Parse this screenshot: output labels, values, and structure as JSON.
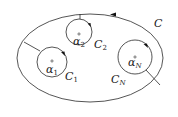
{
  "diagram": {
    "outer_contour": {
      "label": "C"
    },
    "inner_contours": [
      {
        "label": "C",
        "label_sub": "1",
        "point": "α",
        "point_sub": "1"
      },
      {
        "label": "C",
        "label_sub": "2",
        "point": "α",
        "point_sub": "2"
      },
      {
        "label": "C",
        "label_sub": "N",
        "point": "α",
        "point_sub": "N"
      }
    ]
  }
}
